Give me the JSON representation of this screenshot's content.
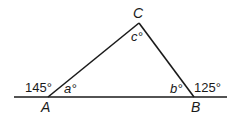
{
  "diagram": {
    "type": "triangle-exterior-angles",
    "vertices": {
      "A": {
        "label": "A",
        "x": 48,
        "y": 97
      },
      "B": {
        "label": "B",
        "x": 194,
        "y": 97
      },
      "C": {
        "label": "C",
        "x": 139,
        "y": 23
      }
    },
    "baseline": {
      "x1": 14,
      "x2": 227,
      "y": 97
    },
    "angles": {
      "a": "a°",
      "b": "b°",
      "c": "c°",
      "exterior_A": "145°",
      "exterior_B": "125°"
    },
    "colors": {
      "stroke": "#1a1a1a",
      "background": "#ffffff"
    }
  }
}
